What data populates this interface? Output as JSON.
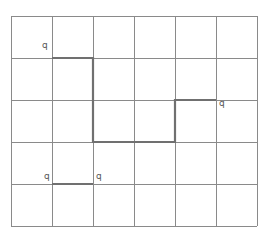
{
  "grid": {
    "columns": 6,
    "rows": 5,
    "x_lines": [
      11,
      52,
      93,
      134,
      175,
      216,
      257
    ],
    "y_lines": [
      16,
      58,
      100,
      142,
      184,
      226
    ],
    "line_color": "#8a8a8a",
    "path_color": "#707070"
  },
  "path": {
    "description": "thick polyline through grid",
    "points": [
      [
        52,
        58
      ],
      [
        93,
        58
      ],
      [
        93,
        142
      ],
      [
        175,
        142
      ],
      [
        175,
        100
      ],
      [
        216,
        100
      ]
    ]
  },
  "segment2": {
    "points": [
      [
        52,
        184
      ],
      [
        93,
        184
      ]
    ]
  },
  "labels": [
    {
      "text": "q",
      "x": 42,
      "y": 47
    },
    {
      "text": "q",
      "x": 219,
      "y": 98
    },
    {
      "text": "q",
      "x": 44,
      "y": 173
    },
    {
      "text": "q",
      "x": 96,
      "y": 173
    }
  ]
}
